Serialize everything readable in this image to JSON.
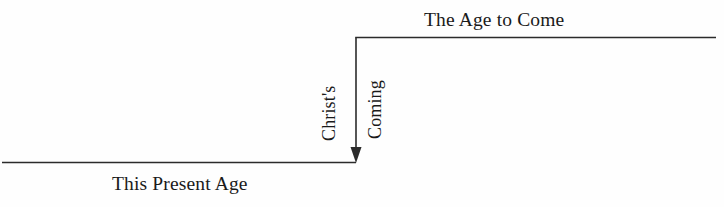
{
  "diagram": {
    "background_color": "#fefefe",
    "ink_color": "#2b2b2b",
    "labels": {
      "present_age": "This Present Age",
      "age_to_come": "The Age to Come",
      "event_line1": "Christ's",
      "event_line2": "Coming"
    },
    "geometry": {
      "lower_line_y": 162,
      "lower_line_x_start": 2,
      "lower_line_x_end": 356,
      "upper_line_y": 37,
      "upper_line_x_start": 356,
      "upper_line_x_end": 716,
      "riser_x": 356,
      "arrow_direction": "down"
    }
  }
}
